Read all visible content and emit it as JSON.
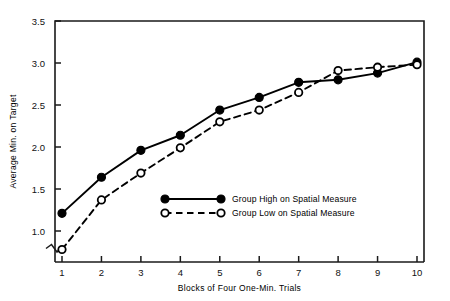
{
  "chart_data": {
    "type": "line",
    "title": "",
    "xlabel": "Blocks of Four One-Min. Trials",
    "ylabel": "Average Min. on Target",
    "x": [
      1,
      2,
      3,
      4,
      5,
      6,
      7,
      8,
      9,
      10
    ],
    "categories": [
      "1",
      "2",
      "3",
      "4",
      "5",
      "6",
      "7",
      "8",
      "9",
      "10"
    ],
    "xtick_labels": [
      "1",
      "2",
      "3",
      "4",
      "5",
      "6",
      "7",
      "8",
      "9",
      "10"
    ],
    "ytick_labels": [
      "1.0",
      "1.5",
      "2.0",
      "2.5",
      "3.0",
      "3.5"
    ],
    "ytick_values": [
      1.0,
      1.5,
      2.0,
      2.5,
      3.0,
      3.5
    ],
    "xlim": [
      0.6,
      10.4
    ],
    "ylim": [
      0.62,
      3.5
    ],
    "y_axis_break": true,
    "grid": false,
    "legend_position": "center",
    "series": [
      {
        "name": "Group High on Spatial Measure",
        "values": [
          1.21,
          1.64,
          1.96,
          2.14,
          2.44,
          2.59,
          2.77,
          2.8,
          2.88,
          3.01
        ],
        "line_style": "solid",
        "marker": "filled-circle",
        "color": "#000000"
      },
      {
        "name": "Group Low on Spatial Measure",
        "values": [
          0.78,
          1.37,
          1.69,
          1.99,
          2.3,
          2.44,
          2.65,
          2.91,
          2.95,
          2.98
        ],
        "line_style": "dashed",
        "marker": "open-circle",
        "color": "#000000"
      }
    ]
  },
  "legend": {
    "entries": [
      {
        "label": "Group High on Spatial Measure"
      },
      {
        "label": "Group Low on Spatial Measure"
      }
    ]
  },
  "axes": {
    "x_title": "Blocks of Four One-Min. Trials",
    "y_title": "Average Min. on Target"
  }
}
